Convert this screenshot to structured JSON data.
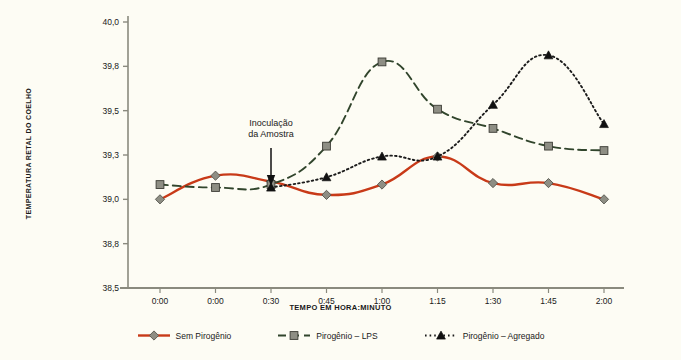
{
  "chart_data": {
    "type": "line",
    "title": "",
    "xlabel": "TEMPO EM HORA:MINUTO",
    "ylabel": "TEMPERATURA RETAL DO COELHO",
    "categories": [
      "0:00",
      "0:00",
      "0:30",
      "0:45",
      "1:00",
      "1:15",
      "1:30",
      "1:45",
      "2:00"
    ],
    "ylim": [
      38.5,
      40.0
    ],
    "yticks": [
      "40,0",
      "39,8",
      "39,5",
      "39,3",
      "39,0",
      "38,8",
      "38,5"
    ],
    "ytick_values": [
      40.0,
      39.8,
      39.5,
      39.3,
      39.0,
      38.8,
      38.5
    ],
    "grid": false,
    "legend_position": "bottom",
    "series": [
      {
        "name": "Sem Pirogênio",
        "color": "#c83a18",
        "style": "solid",
        "marker": "diamond",
        "values": [
          39.0,
          39.16,
          39.12,
          39.03,
          39.1,
          39.29,
          39.11,
          39.11,
          39.0
        ]
      },
      {
        "name": "Pirogênio – LPS",
        "color": "#31452c",
        "style": "dashed",
        "marker": "square",
        "values": [
          39.1,
          39.08,
          39.1,
          39.34,
          39.82,
          39.51,
          39.42,
          39.34,
          39.32
        ]
      },
      {
        "name": "Pirogênio – Agregado",
        "color": "#1b1b1b",
        "style": "dotted",
        "marker": "triangle",
        "values": [
          null,
          null,
          39.08,
          39.15,
          39.29,
          39.29,
          39.54,
          39.85,
          39.44
        ]
      }
    ],
    "annotations": [
      {
        "text_line1": "Inoculação",
        "text_line2": "da Amostra",
        "points_to_category": "0:30",
        "arrow": "down"
      }
    ]
  },
  "legend": {
    "items": [
      {
        "label": "Sem Pirogênio"
      },
      {
        "label": "Pirogênio – LPS"
      },
      {
        "label": "Pirogênio – Agregado"
      }
    ]
  }
}
